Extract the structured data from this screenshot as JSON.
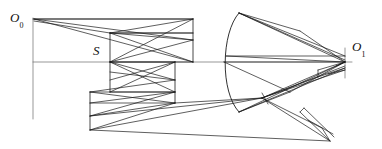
{
  "figure": {
    "kind": "optical-ray-diagram",
    "width": 382,
    "height": 149,
    "background": "#ffffff",
    "stroke_color": "#1a1a1a",
    "axis_color": "#555555"
  },
  "labels": {
    "source": {
      "base": "O",
      "sub": "0",
      "x": 10,
      "y": 11
    },
    "stop": {
      "base": "S",
      "sub": "",
      "x": 93,
      "y": 44
    },
    "image": {
      "base": "O",
      "sub": "1",
      "x": 352,
      "y": 40
    }
  },
  "axis": {
    "optical_axis": {
      "x1": 33,
      "y1": 62,
      "x2": 352,
      "y2": 62
    },
    "left_marker": {
      "x1": 33,
      "y1": 18,
      "x2": 33,
      "y2": 119
    },
    "right_marker": {
      "x1": 345,
      "y1": 48,
      "x2": 345,
      "y2": 78
    }
  },
  "elements": {
    "mirror_arc": {
      "name": "concave-mirror-arc",
      "path": "M 239 13 C 221 32, 220 92, 239 112"
    },
    "stop_plane": {
      "x1": 110,
      "y1": 33,
      "x2": 110,
      "y2": 92
    },
    "panel_right_upper": {
      "x1": 193,
      "y1": 20,
      "x2": 193,
      "y2": 62
    },
    "panel_right_lower": {
      "x1": 175,
      "y1": 62,
      "x2": 175,
      "y2": 103
    },
    "panel_left_lower": {
      "x1": 90,
      "y1": 92,
      "x2": 90,
      "y2": 130
    },
    "apex_vertex": {
      "x": 262,
      "y": 98
    }
  },
  "ray_bundles": [
    {
      "name": "upper-fan-from-source",
      "count": 3
    },
    {
      "name": "crossing-bundle-upper",
      "count": 4
    },
    {
      "name": "crossing-bundle-middle",
      "count": 4
    },
    {
      "name": "crossing-bundle-lower",
      "count": 4
    },
    {
      "name": "mirror-return-bundle",
      "count": 5
    },
    {
      "name": "lower-return-bundle",
      "count": 4
    }
  ]
}
